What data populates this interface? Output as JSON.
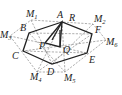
{
  "diagram": {
    "type": "geometry",
    "points": {
      "A": {
        "label": "A",
        "x": 62,
        "y": 22
      },
      "B": {
        "label": "B",
        "x": 29,
        "y": 33
      },
      "C": {
        "label": "C",
        "x": 23,
        "y": 51
      },
      "D": {
        "label": "D",
        "x": 52,
        "y": 64
      },
      "E": {
        "label": "E",
        "x": 87,
        "y": 53
      },
      "F": {
        "label": "F",
        "x": 92,
        "y": 34
      },
      "P": {
        "label": "P",
        "x": 45,
        "y": 43
      },
      "Q": {
        "label": "Q",
        "x": 60,
        "y": 47
      },
      "R": {
        "label": "R",
        "x": 72,
        "y": 23
      },
      "M1": {
        "label": "M",
        "sub": "1",
        "x": 31,
        "y": 20
      },
      "M2": {
        "label": "M",
        "sub": "2",
        "x": 93,
        "y": 24
      },
      "M3": {
        "label": "M",
        "sub": "3",
        "x": 10,
        "y": 36
      },
      "M4": {
        "label": "M",
        "sub": "4",
        "x": 37,
        "y": 72
      },
      "M5": {
        "label": "M",
        "sub": "5",
        "x": 65,
        "y": 72
      },
      "M6": {
        "label": "M",
        "sub": "6",
        "x": 106,
        "y": 40
      }
    },
    "labels": {
      "A": "A",
      "B": "B",
      "C": "C",
      "D": "D",
      "E": "E",
      "F": "F",
      "P": "P",
      "Q": "Q",
      "R": "R",
      "M": "M",
      "s1": "1",
      "s2": "2",
      "s3": "3",
      "s4": "4",
      "s5": "5",
      "s6": "6"
    },
    "solid_segments": [
      [
        "A",
        "B"
      ],
      [
        "B",
        "C"
      ],
      [
        "C",
        "D"
      ],
      [
        "D",
        "E"
      ],
      [
        "E",
        "F"
      ],
      [
        "F",
        "A"
      ],
      [
        "A",
        "P"
      ],
      [
        "P",
        "Q"
      ],
      [
        "Q",
        "A"
      ]
    ],
    "dashed_segments": [
      [
        "M1",
        "M2"
      ],
      [
        "M2",
        "M6"
      ],
      [
        "M6",
        "M5"
      ],
      [
        "M5",
        "M4"
      ],
      [
        "M4",
        "M3"
      ],
      [
        "M3",
        "M1"
      ],
      [
        "B",
        "F"
      ],
      [
        "C",
        "E"
      ],
      [
        "M1",
        "D"
      ],
      [
        "M3",
        "E"
      ],
      [
        "M4",
        "F"
      ],
      [
        "M2",
        "C"
      ],
      [
        "M6",
        "B"
      ],
      [
        "M5",
        "A"
      ]
    ]
  }
}
